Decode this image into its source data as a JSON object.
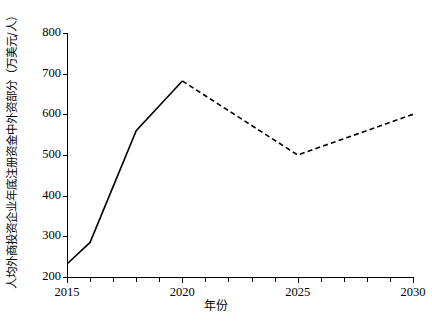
{
  "chart_data": {
    "type": "line",
    "title": "",
    "xlabel": "年份",
    "ylabel": "人均外商投资企业年底注册资金中外资部分（万美元/人）",
    "xlim": [
      2015,
      2030
    ],
    "ylim": [
      200,
      800
    ],
    "grid": false,
    "legend": false,
    "x_ticks": [
      2015,
      2016,
      2017,
      2018,
      2019,
      2020,
      2021,
      2022,
      2023,
      2024,
      2025,
      2026,
      2027,
      2028,
      2029,
      2030
    ],
    "x_tick_labels": [
      "2015",
      "",
      "",
      "",
      "",
      "2020",
      "",
      "",
      "",
      "",
      "2025",
      "",
      "",
      "",
      "",
      "2030"
    ],
    "y_ticks": [
      200,
      300,
      400,
      500,
      600,
      700,
      800
    ],
    "y_tick_labels": [
      "200",
      "300",
      "400",
      "500",
      "600",
      "700",
      "800"
    ],
    "line_color": "#000000",
    "series": [
      {
        "name": "历史值",
        "style": "solid",
        "x": [
          2015,
          2016,
          2018,
          2020
        ],
        "values": [
          232,
          285,
          560,
          682
        ]
      },
      {
        "name": "预测值",
        "style": "dashed",
        "x": [
          2020,
          2025,
          2030
        ],
        "values": [
          682,
          500,
          600
        ]
      }
    ]
  }
}
